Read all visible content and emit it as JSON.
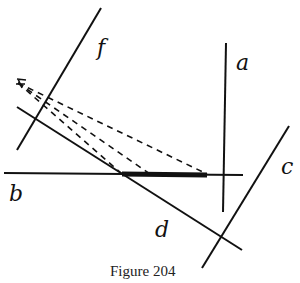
{
  "figure": {
    "caption": "Figure 204",
    "labels": {
      "a": "a",
      "b": "b",
      "c": "c",
      "d": "d",
      "f": "f"
    },
    "eye_marker": "viewpoint",
    "colors": {
      "ink": "#111111",
      "background": "#ffffff"
    }
  }
}
